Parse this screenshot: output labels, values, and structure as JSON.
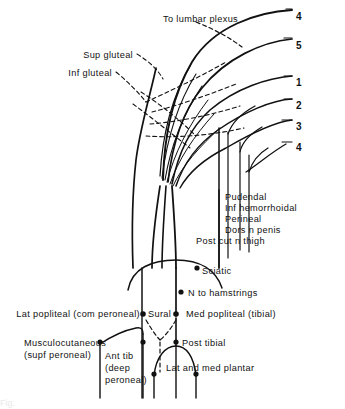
{
  "figure": {
    "background_color": "#ffffff",
    "ink_color": "#111111",
    "width": 345,
    "height": 409
  },
  "upper_labels": [
    {
      "id": "to-lumbar-plexus",
      "text": "To lumbar plexus",
      "x": 163,
      "y": 14,
      "align": "center"
    },
    {
      "id": "sup-gluteal",
      "text": "Sup gluteal",
      "x": 133,
      "y": 50,
      "align": "right"
    },
    {
      "id": "inf-gluteal",
      "text": "Inf gluteal",
      "x": 112,
      "y": 68,
      "align": "right"
    }
  ],
  "root_numbers": [
    {
      "id": "root-l4",
      "label": "4",
      "x": 296,
      "y": 11
    },
    {
      "id": "root-l5",
      "label": "5",
      "x": 296,
      "y": 40
    },
    {
      "id": "root-s1",
      "label": "1",
      "x": 296,
      "y": 77
    },
    {
      "id": "root-s2",
      "label": "2",
      "x": 296,
      "y": 100
    },
    {
      "id": "root-s3",
      "label": "3",
      "x": 296,
      "y": 121
    },
    {
      "id": "root-s4",
      "label": "4",
      "x": 296,
      "y": 142
    }
  ],
  "pelvic_branch_labels": [
    {
      "id": "pudendal",
      "text": "Pudendal",
      "x": 225,
      "y": 196
    },
    {
      "id": "inf-hemorrhoidal",
      "text": "Inf hemorrhoidal",
      "x": 225,
      "y": 207
    },
    {
      "id": "perineal",
      "text": "Perineal",
      "x": 225,
      "y": 218
    },
    {
      "id": "dors-n-penis",
      "text": "Dors n penis",
      "x": 225,
      "y": 229
    },
    {
      "id": "post-cut-n-thigh",
      "text": "Post cut n thigh",
      "x": 196,
      "y": 240
    }
  ],
  "lower_labels": [
    {
      "id": "sciatic",
      "text": "Sciatic",
      "x": 200,
      "y": 272
    },
    {
      "id": "n-to-hamstrings",
      "text": "N to hamstrings",
      "x": 190,
      "y": 297
    },
    {
      "id": "lat-popliteal",
      "text": "Lat popliteal (com peroneal)",
      "x": 9,
      "y": 317
    },
    {
      "id": "sural",
      "text": "Sural",
      "x": 147,
      "y": 317
    },
    {
      "id": "med-popliteal",
      "text": "Med popliteal (tibial)",
      "x": 187,
      "y": 317
    },
    {
      "id": "musculocutaneous-1",
      "text": "Musculocutaneous",
      "x": 24,
      "y": 345
    },
    {
      "id": "musculocutaneous-2",
      "text": "(supf peroneal)",
      "x": 24,
      "y": 357
    },
    {
      "id": "post-tibial",
      "text": "Post tibial",
      "x": 180,
      "y": 345
    },
    {
      "id": "ant-tib-1",
      "text": "Ant tib",
      "x": 105,
      "y": 357
    },
    {
      "id": "ant-tib-2",
      "text": "(deep",
      "x": 105,
      "y": 369
    },
    {
      "id": "ant-tib-3",
      "text": "peroneal)",
      "x": 105,
      "y": 381
    },
    {
      "id": "lat-and-med-plantar",
      "text": "Lat and med plantar",
      "x": 165,
      "y": 369
    }
  ],
  "footer": {
    "cut_off_caption": "Fig."
  }
}
